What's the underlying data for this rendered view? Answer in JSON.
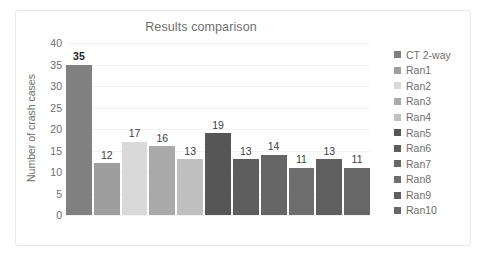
{
  "chart_data": {
    "type": "bar",
    "title": "Results comparison",
    "xlabel": "",
    "ylabel": "Number of crash cases",
    "ylim": [
      0,
      40
    ],
    "ytick_step": 5,
    "yticks": [
      40,
      35,
      30,
      25,
      20,
      15,
      10,
      5,
      0
    ],
    "grid": true,
    "legend_position": "right",
    "categories": [
      "CT 2-way",
      "Ran1",
      "Ran2",
      "Ran3",
      "Ran4",
      "Ran5",
      "Ran6",
      "Ran7",
      "Ran8",
      "Ran9",
      "Ran10"
    ],
    "values": [
      35,
      12,
      17,
      16,
      13,
      19,
      13,
      14,
      11,
      13,
      11
    ],
    "data_labels": [
      "35",
      "12",
      "17",
      "16",
      "13",
      "19",
      "13",
      "14",
      "11",
      "13",
      "11"
    ],
    "emphasized_label_index": 0,
    "colors": [
      "#808080",
      "#9e9e9e",
      "#d9d9d9",
      "#a9a9a9",
      "#c0c0c0",
      "#565656",
      "#5e5e5e",
      "#666666",
      "#6e6e6e",
      "#5f5f5f",
      "#676767"
    ],
    "bars": [
      {
        "name": "CT 2-way",
        "value": 35,
        "label": "35",
        "color": "#808080",
        "bold": true
      },
      {
        "name": "Ran1",
        "value": 12,
        "label": "12",
        "color": "#9e9e9e",
        "bold": false
      },
      {
        "name": "Ran2",
        "value": 17,
        "label": "17",
        "color": "#d9d9d9",
        "bold": false
      },
      {
        "name": "Ran3",
        "value": 16,
        "label": "16",
        "color": "#a9a9a9",
        "bold": false
      },
      {
        "name": "Ran4",
        "value": 13,
        "label": "13",
        "color": "#c0c0c0",
        "bold": false
      },
      {
        "name": "Ran5",
        "value": 19,
        "label": "19",
        "color": "#565656",
        "bold": false
      },
      {
        "name": "Ran6",
        "value": 13,
        "label": "13",
        "color": "#5e5e5e",
        "bold": false
      },
      {
        "name": "Ran7",
        "value": 14,
        "label": "14",
        "color": "#666666",
        "bold": false
      },
      {
        "name": "Ran8",
        "value": 11,
        "label": "11",
        "color": "#6e6e6e",
        "bold": false
      },
      {
        "name": "Ran9",
        "value": 13,
        "label": "13",
        "color": "#5f5f5f",
        "bold": false
      },
      {
        "name": "Ran10",
        "value": 11,
        "label": "11",
        "color": "#676767",
        "bold": false
      }
    ],
    "legend": [
      {
        "label": "CT 2-way",
        "color": "#808080"
      },
      {
        "label": "Ran1",
        "color": "#9e9e9e"
      },
      {
        "label": "Ran2",
        "color": "#d9d9d9"
      },
      {
        "label": "Ran3",
        "color": "#a9a9a9"
      },
      {
        "label": "Ran4",
        "color": "#c0c0c0"
      },
      {
        "label": "Ran5",
        "color": "#565656"
      },
      {
        "label": "Ran6",
        "color": "#5e5e5e"
      },
      {
        "label": "Ran7",
        "color": "#666666"
      },
      {
        "label": "Ran8",
        "color": "#6e6e6e"
      },
      {
        "label": "Ran9",
        "color": "#5f5f5f"
      },
      {
        "label": "Ran10",
        "color": "#676767"
      }
    ]
  }
}
